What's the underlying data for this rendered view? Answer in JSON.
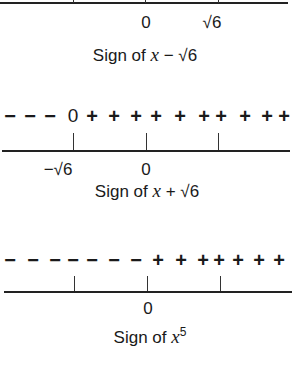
{
  "figure": {
    "panels": [
      {
        "id": "x-minus-sqrt6",
        "caption_prefix": "Sign of ",
        "caption_var": "x",
        "caption_suffix": " − √6",
        "axis_labels": [
          {
            "text": "0",
            "x": 146
          },
          {
            "text": "√6",
            "x": 211
          }
        ],
        "ticks_x": [
          73,
          146,
          218
        ]
      },
      {
        "id": "x-plus-sqrt6",
        "caption_prefix": "Sign of ",
        "caption_var": "x",
        "caption_suffix": " + √6",
        "sign_row": [
          "−",
          "−",
          "−",
          "0",
          "+",
          "+",
          "+",
          "+",
          "+",
          "+",
          "+",
          "+",
          "+",
          "+"
        ],
        "axis_labels": [
          {
            "text": "−√6",
            "x": 62
          },
          {
            "text": "0",
            "x": 146
          }
        ],
        "ticks_x": [
          73,
          146,
          218
        ]
      },
      {
        "id": "x-fifth",
        "caption_prefix": "Sign of ",
        "caption_var": "x",
        "caption_sup": "5",
        "sign_row": [
          "−",
          "−",
          "−",
          "−",
          "−",
          "−",
          "−",
          "+",
          "+",
          "+",
          "+",
          "+",
          "+",
          "+"
        ],
        "axis_labels": [
          {
            "text": "0",
            "x": 148
          }
        ],
        "ticks_x": [
          74,
          147,
          220
        ]
      }
    ]
  }
}
